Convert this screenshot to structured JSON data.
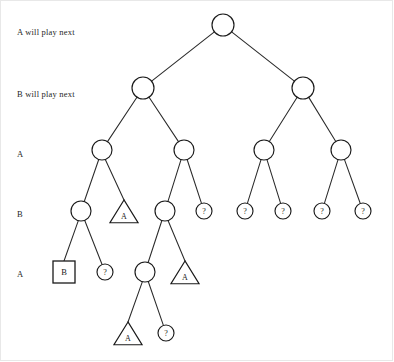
{
  "figure": {
    "background_color": "#ffffff",
    "line_color": "#1a1a1a"
  },
  "row_labels": [
    {
      "id": "row-0",
      "text": "A will play next",
      "x": 17,
      "y": 33
    },
    {
      "id": "row-1",
      "text": "B will play next",
      "x": 17,
      "y": 95
    },
    {
      "id": "row-2",
      "text": "A",
      "x": 17,
      "y": 155
    },
    {
      "id": "row-3",
      "text": "B",
      "x": 17,
      "y": 215
    },
    {
      "id": "row-4",
      "text": "A",
      "x": 17,
      "y": 275
    }
  ],
  "chart_data": {
    "type": "diagram",
    "diagram_kind": "game-tree",
    "levels": [
      {
        "level": 0,
        "y": 25,
        "label": "A will play next"
      },
      {
        "level": 1,
        "y": 88,
        "label": "B will play next"
      },
      {
        "level": 2,
        "y": 150,
        "label": "A"
      },
      {
        "level": 3,
        "y": 211,
        "label": "B"
      },
      {
        "level": 4,
        "y": 272,
        "label": "A"
      },
      {
        "level": 5,
        "y": 333,
        "label": ""
      }
    ],
    "node_shapes": {
      "circle": "internal or unexpanded node",
      "triangle": "terminal node won by A",
      "square": "terminal node won by B",
      "question": "unevaluated node"
    },
    "nodes": [
      {
        "id": "n0",
        "shape": "circle",
        "label": "",
        "x": 223,
        "y": 25,
        "r": 11,
        "level": 0
      },
      {
        "id": "n1",
        "shape": "circle",
        "label": "",
        "x": 143,
        "y": 88,
        "r": 11,
        "level": 1
      },
      {
        "id": "n2",
        "shape": "circle",
        "label": "",
        "x": 303,
        "y": 88,
        "r": 11,
        "level": 1
      },
      {
        "id": "n3",
        "shape": "circle",
        "label": "",
        "x": 102,
        "y": 150,
        "r": 10,
        "level": 2
      },
      {
        "id": "n4",
        "shape": "circle",
        "label": "",
        "x": 184,
        "y": 150,
        "r": 10,
        "level": 2
      },
      {
        "id": "n5",
        "shape": "circle",
        "label": "",
        "x": 264,
        "y": 150,
        "r": 10,
        "level": 2
      },
      {
        "id": "n6",
        "shape": "circle",
        "label": "",
        "x": 341,
        "y": 150,
        "r": 10,
        "level": 2
      },
      {
        "id": "n7",
        "shape": "circle",
        "label": "",
        "x": 81,
        "y": 211,
        "r": 10,
        "level": 3
      },
      {
        "id": "n8",
        "shape": "triangle",
        "label": "A",
        "x": 124,
        "y": 213,
        "size": 13,
        "level": 3
      },
      {
        "id": "n9",
        "shape": "circle",
        "label": "",
        "x": 165,
        "y": 211,
        "r": 10,
        "level": 3
      },
      {
        "id": "n10",
        "shape": "circle",
        "label": "?",
        "x": 204,
        "y": 211,
        "r": 8,
        "level": 3
      },
      {
        "id": "n11",
        "shape": "circle",
        "label": "?",
        "x": 245,
        "y": 211,
        "r": 8,
        "level": 3
      },
      {
        "id": "n12",
        "shape": "circle",
        "label": "?",
        "x": 283,
        "y": 211,
        "r": 8,
        "level": 3
      },
      {
        "id": "n13",
        "shape": "circle",
        "label": "?",
        "x": 322,
        "y": 211,
        "r": 8,
        "level": 3
      },
      {
        "id": "n14",
        "shape": "circle",
        "label": "?",
        "x": 363,
        "y": 211,
        "r": 8,
        "level": 3
      },
      {
        "id": "n15",
        "shape": "square",
        "label": "B",
        "x": 64,
        "y": 272,
        "size": 22,
        "level": 4
      },
      {
        "id": "n16",
        "shape": "circle",
        "label": "?",
        "x": 105,
        "y": 272,
        "r": 8,
        "level": 4
      },
      {
        "id": "n17",
        "shape": "circle",
        "label": "",
        "x": 145,
        "y": 272,
        "r": 10,
        "level": 4
      },
      {
        "id": "n18",
        "shape": "triangle",
        "label": "A",
        "x": 185,
        "y": 274,
        "size": 13,
        "level": 4
      },
      {
        "id": "n19",
        "shape": "triangle",
        "label": "A",
        "x": 128,
        "y": 335,
        "size": 13,
        "level": 5
      },
      {
        "id": "n20",
        "shape": "circle",
        "label": "?",
        "x": 166,
        "y": 333,
        "r": 8,
        "level": 5
      }
    ],
    "edges": [
      {
        "from": "n0",
        "to": "n1"
      },
      {
        "from": "n0",
        "to": "n2"
      },
      {
        "from": "n1",
        "to": "n3"
      },
      {
        "from": "n1",
        "to": "n4"
      },
      {
        "from": "n2",
        "to": "n5"
      },
      {
        "from": "n2",
        "to": "n6"
      },
      {
        "from": "n3",
        "to": "n7"
      },
      {
        "from": "n3",
        "to": "n8"
      },
      {
        "from": "n4",
        "to": "n9"
      },
      {
        "from": "n4",
        "to": "n10"
      },
      {
        "from": "n5",
        "to": "n11"
      },
      {
        "from": "n5",
        "to": "n12"
      },
      {
        "from": "n6",
        "to": "n13"
      },
      {
        "from": "n6",
        "to": "n14"
      },
      {
        "from": "n7",
        "to": "n15"
      },
      {
        "from": "n7",
        "to": "n16"
      },
      {
        "from": "n9",
        "to": "n17"
      },
      {
        "from": "n9",
        "to": "n18"
      },
      {
        "from": "n17",
        "to": "n19"
      },
      {
        "from": "n17",
        "to": "n20"
      }
    ]
  }
}
